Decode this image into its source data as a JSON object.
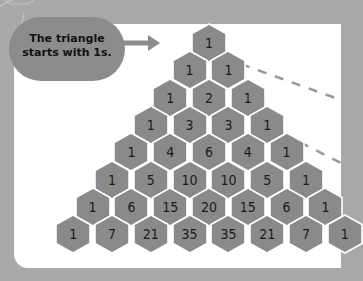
{
  "callout": {
    "line1": "The triangle",
    "line2": "starts with 1s."
  },
  "colors": {
    "frame": "#a9a9a9",
    "panel": "#ffffff",
    "cell": "#8a8a8a",
    "cell_border": "#ffffff",
    "callout": "#8c8c8c",
    "dash": "#9a9a9a"
  },
  "triangle": {
    "rows": [
      [
        "1"
      ],
      [
        "1",
        "1"
      ],
      [
        "1",
        "2",
        "1"
      ],
      [
        "1",
        "3",
        "3",
        "1"
      ],
      [
        "1",
        "4",
        "6",
        "4",
        "1"
      ],
      [
        "1",
        "5",
        "10",
        "10",
        "5",
        "1"
      ],
      [
        "1",
        "6",
        "15",
        "20",
        "15",
        "6",
        "1"
      ],
      [
        "1",
        "7",
        "21",
        "35",
        "35",
        "21",
        "7",
        "1"
      ]
    ]
  }
}
